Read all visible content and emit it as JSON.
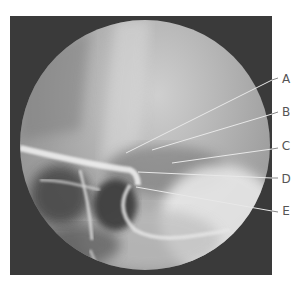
{
  "figure": {
    "type": "radiograph",
    "labels": [
      {
        "letter": "A",
        "y": 80
      },
      {
        "letter": "B",
        "y": 113
      },
      {
        "letter": "C",
        "y": 147
      },
      {
        "letter": "D",
        "y": 180
      },
      {
        "letter": "E",
        "y": 212
      }
    ]
  }
}
